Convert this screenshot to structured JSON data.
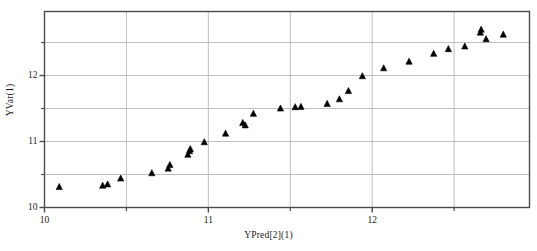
{
  "chart_data": {
    "type": "scatter",
    "title": "",
    "xlabel": "YPred[2](1)",
    "ylabel": "YVar(1)",
    "xlim": [
      10.0,
      12.96
    ],
    "ylim": [
      10.0,
      12.97
    ],
    "xticks": [
      10,
      11,
      12
    ],
    "xticklabels": [
      "10",
      "11",
      "12"
    ],
    "xminorticks": [
      10.5,
      11.5,
      12.5
    ],
    "yticks": [
      10,
      11,
      12
    ],
    "yticklabels": [
      "10",
      "11",
      "12"
    ],
    "yminorticks": [
      10.5,
      11.5,
      12.5
    ],
    "grid": true,
    "grid_color": "#b0b0b0",
    "legend": "none",
    "marker": "triangle-up",
    "marker_color": "#000000",
    "marker_size": 6,
    "series": [
      {
        "name": "YVar(1) vs YPred[2](1)",
        "points": [
          [
            10.09,
            10.31
          ],
          [
            10.355,
            10.33
          ],
          [
            10.385,
            10.35
          ],
          [
            10.465,
            10.44
          ],
          [
            10.655,
            10.52
          ],
          [
            10.755,
            10.59
          ],
          [
            10.765,
            10.645
          ],
          [
            10.875,
            10.8
          ],
          [
            10.885,
            10.855
          ],
          [
            10.89,
            10.885
          ],
          [
            10.975,
            10.99
          ],
          [
            11.105,
            11.12
          ],
          [
            11.21,
            11.28
          ],
          [
            11.225,
            11.245
          ],
          [
            11.275,
            11.42
          ],
          [
            11.44,
            11.5
          ],
          [
            11.53,
            11.52
          ],
          [
            11.565,
            11.525
          ],
          [
            11.725,
            11.57
          ],
          [
            11.8,
            11.64
          ],
          [
            11.855,
            11.765
          ],
          [
            11.94,
            11.99
          ],
          [
            12.07,
            12.11
          ],
          [
            12.225,
            12.21
          ],
          [
            12.375,
            12.33
          ],
          [
            12.465,
            12.4
          ],
          [
            12.565,
            12.44
          ],
          [
            12.66,
            12.65
          ],
          [
            12.665,
            12.695
          ],
          [
            12.695,
            12.55
          ],
          [
            12.8,
            12.62
          ]
        ]
      }
    ]
  },
  "axes": {
    "frame_color": "#4a4a4a"
  }
}
